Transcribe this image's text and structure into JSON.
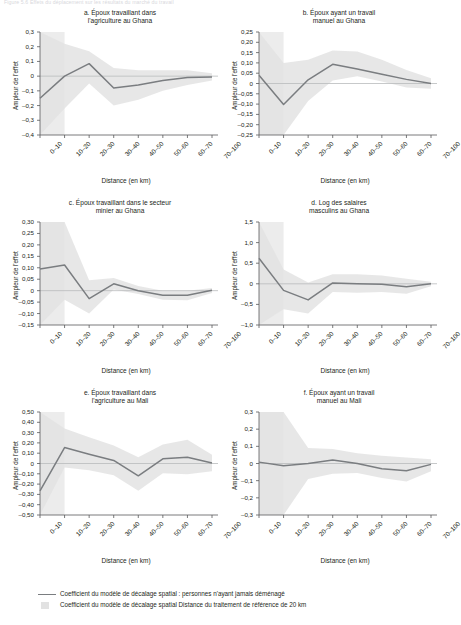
{
  "header": {
    "faded_top_text": "Figure 5.6  Effets du déplacement sur les résultats du marché du travail"
  },
  "axis": {
    "ylabel": "Ampleur de l'effet",
    "xlabel": "Distance (en km)"
  },
  "legend": {
    "line_label": "Coefficient du modèle de décalage spatial : personnes n'ayant jamais déménagé",
    "band_label": "Coefficient du modèle de décalage spatial Distance du traitement de référence de 20 km"
  },
  "chart_data": [
    {
      "type": "line",
      "panel": "a",
      "title": "a. Époux travaillant dans l'agriculture au Ghana",
      "title_line1": "a. Époux travaillant dans",
      "title_line2": "l'agriculture au Ghana",
      "xlabel": "Distance (en km)",
      "ylabel": "Ampleur de l'effet",
      "categories": [
        "0–10",
        "10–20",
        "20–30",
        "30–40",
        "40–50",
        "50–60",
        "60–70",
        "70–100"
      ],
      "yticks": [
        "0,3",
        "0,2",
        "0,1",
        "0",
        "-0,1",
        "-0,2",
        "-0,3",
        "-0,4"
      ],
      "ylim": [
        -0.4,
        0.3
      ],
      "grid": false,
      "series": [
        {
          "name": "Coefficient du modèle de décalage spatial : personnes n'ayant jamais déménagé",
          "values": [
            -0.15,
            0.0,
            0.085,
            -0.08,
            -0.06,
            -0.03,
            -0.01,
            -0.005
          ]
        }
      ],
      "band_upper": [
        0.3,
        0.22,
        0.17,
        0.055,
        0.04,
        0.04,
        0.04,
        0.02
      ],
      "band_lower": [
        -0.4,
        -0.22,
        -0.05,
        -0.2,
        -0.16,
        -0.1,
        -0.06,
        -0.03
      ],
      "ref_shade_until_index": 1
    },
    {
      "type": "line",
      "panel": "b",
      "title": "b. Époux ayant un travail manuel au Ghana",
      "title_line1": "b. Époux ayant un travail",
      "title_line2": "manuel au Ghana",
      "xlabel": "Distance (en km)",
      "ylabel": "Ampleur de l'effet",
      "categories": [
        "0–10",
        "10–20",
        "20–30",
        "30–40",
        "40–50",
        "50–60",
        "60–70",
        "70–100"
      ],
      "yticks": [
        "0,25",
        "0,20",
        "0,15",
        "0,10",
        "0,05",
        "0",
        "-0,05",
        "-0,10",
        "-0,15",
        "-0,20",
        "-0,25"
      ],
      "ylim": [
        -0.25,
        0.25
      ],
      "grid": false,
      "series": [
        {
          "name": "Coefficient du modèle de décalage spatial : personnes n'ayant jamais déménagé",
          "values": [
            0.04,
            -0.102,
            0.018,
            0.093,
            0.07,
            0.045,
            0.02,
            0.0
          ]
        }
      ],
      "band_upper": [
        0.25,
        0.1,
        0.115,
        0.16,
        0.155,
        0.115,
        0.065,
        0.025
      ],
      "band_lower": [
        -0.25,
        -0.25,
        -0.085,
        0.015,
        0.035,
        0.01,
        -0.02,
        -0.025
      ],
      "ref_shade_until_index": 1
    },
    {
      "type": "line",
      "panel": "c",
      "title": "c. Époux travaillant dans le secteur minier au Ghana",
      "title_line1": "c. Époux travaillant dans le secteur",
      "title_line2": "minier au Ghana",
      "xlabel": "Distance (en km)",
      "ylabel": "Ampleur de l'effet",
      "categories": [
        "0–10",
        "10–20",
        "20–30",
        "30–40",
        "40–50",
        "50–60",
        "60–70",
        "70–100"
      ],
      "yticks": [
        "0,30",
        "0,25",
        "0,20",
        "0,15",
        "0,10",
        "0,05",
        "0",
        "-0,05",
        "-0,10",
        "-0,15"
      ],
      "ylim": [
        -0.15,
        0.3
      ],
      "grid": false,
      "series": [
        {
          "name": "Coefficient du modèle de décalage spatial : personnes n'ayant jamais déménagé",
          "values": [
            0.095,
            0.112,
            -0.035,
            0.03,
            0.0,
            -0.02,
            -0.02,
            0.002
          ]
        }
      ],
      "band_upper": [
        0.3,
        0.3,
        0.045,
        0.055,
        0.02,
        0.0,
        0.0,
        0.012
      ],
      "band_lower": [
        -0.15,
        -0.04,
        -0.1,
        0.005,
        -0.015,
        -0.04,
        -0.042,
        -0.01
      ],
      "ref_shade_until_index": 1
    },
    {
      "type": "line",
      "panel": "d",
      "title": "d. Log des salaires masculins au Ghana",
      "title_line1": "d. Log des salaires",
      "title_line2": "masculins au Ghana",
      "xlabel": "Distance (en km)",
      "ylabel": "Ampleur de l'effet",
      "categories": [
        "0–10",
        "10–20",
        "20–30",
        "30–40",
        "40–50",
        "50–60",
        "60–70",
        "70–100"
      ],
      "yticks": [
        "1,5",
        "1,0",
        "0,5",
        "0",
        "-0,5",
        "-1,0"
      ],
      "ylim": [
        -1.0,
        1.5
      ],
      "grid": false,
      "series": [
        {
          "name": "Coefficient du modèle de décalage spatial : personnes n'ayant jamais déménagé",
          "values": [
            0.62,
            -0.16,
            -0.39,
            0.02,
            0.0,
            -0.01,
            -0.07,
            0.0
          ]
        }
      ],
      "band_upper": [
        1.5,
        0.35,
        0.03,
        0.23,
        0.23,
        0.2,
        0.12,
        0.05
      ],
      "band_lower": [
        -1.0,
        -0.62,
        -0.72,
        -0.2,
        -0.22,
        -0.2,
        -0.24,
        -0.06
      ],
      "ref_shade_until_index": 1
    },
    {
      "type": "line",
      "panel": "e",
      "title": "e. Époux travaillant dans l'agriculture au Mali",
      "title_line1": "e. Époux travaillant dans",
      "title_line2": "l'agriculture au Mali",
      "xlabel": "Distance (en km)",
      "ylabel": "Ampleur de l'effet",
      "categories": [
        "0–10",
        "10–20",
        "20–30",
        "30–40",
        "40–50",
        "50–60",
        "60–70",
        "70–100"
      ],
      "yticks": [
        "0,50",
        "0,40",
        "0,30",
        "0,20",
        "0,10",
        "0",
        "-0,10",
        "-0,20",
        "-0,30",
        "-0,40",
        "-0,50"
      ],
      "ylim": [
        -0.5,
        0.5
      ],
      "grid": false,
      "series": [
        {
          "name": "Coefficient du modèle de décalage spatial : personnes n'ayant jamais déménagé",
          "values": [
            -0.265,
            0.155,
            0.09,
            0.03,
            -0.12,
            0.045,
            0.06,
            0.005
          ]
        }
      ],
      "band_upper": [
        0.5,
        0.34,
        0.255,
        0.175,
        0.06,
        0.185,
        0.23,
        0.085
      ],
      "band_lower": [
        -0.5,
        -0.04,
        -0.065,
        -0.115,
        -0.265,
        -0.095,
        -0.105,
        -0.075
      ],
      "ref_shade_until_index": 1
    },
    {
      "type": "line",
      "panel": "f",
      "title": "f. Époux ayant un travail manuel au Mali",
      "title_line1": "f. Époux ayant un travail",
      "title_line2": "manuel au Mali",
      "xlabel": "Distance (en km)",
      "ylabel": "Ampleur de l'effet",
      "categories": [
        "0–10",
        "10–20",
        "20–30",
        "30–40",
        "40–50",
        "50–60",
        "60–70",
        "70–100"
      ],
      "yticks": [
        "0,3",
        "0,2",
        "0,1",
        "0",
        "-0,1",
        "-0,2",
        "-0,3"
      ],
      "ylim": [
        -0.3,
        0.3
      ],
      "grid": false,
      "series": [
        {
          "name": "Coefficient du modèle de décalage spatial : personnes n'ayant jamais déménagé",
          "values": [
            0.008,
            -0.013,
            0.0,
            0.02,
            0.0,
            -0.03,
            -0.042,
            -0.005
          ]
        }
      ],
      "band_upper": [
        0.3,
        0.3,
        0.09,
        0.085,
        0.06,
        0.045,
        0.035,
        0.025
      ],
      "band_lower": [
        -0.3,
        -0.3,
        -0.09,
        -0.06,
        -0.055,
        -0.085,
        -0.105,
        -0.045
      ],
      "ref_shade_until_index": 1
    }
  ],
  "colors": {
    "line": "#7a7d80",
    "band": "#e3e3e3",
    "axis": "#58595b",
    "zero_line": "#b9bbbd",
    "text": "#231f20"
  }
}
